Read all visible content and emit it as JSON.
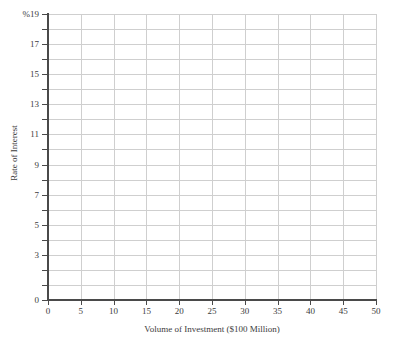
{
  "chart_data": {
    "type": "line",
    "title": "",
    "subtitle": "",
    "xlabel": "Volume of Investment ($100 Million)",
    "ylabel": "Rate of Interest",
    "y_unit_label": "%19",
    "xlim": [
      0,
      50
    ],
    "ylim": [
      0,
      19
    ],
    "x_ticks": [
      0,
      5,
      10,
      15,
      20,
      25,
      30,
      35,
      40,
      45,
      50
    ],
    "x_tick_labels": [
      "0",
      "5",
      "10",
      "15",
      "20",
      "25",
      "30",
      "35",
      "40",
      "45",
      "50"
    ],
    "y_ticks": [
      0,
      1,
      2,
      3,
      4,
      5,
      6,
      7,
      8,
      9,
      10,
      11,
      12,
      13,
      14,
      15,
      16,
      17,
      18,
      19
    ],
    "y_labeled_ticks": [
      0,
      3,
      5,
      7,
      9,
      11,
      13,
      15,
      17,
      19
    ],
    "y_tick_labels": [
      "0",
      "3",
      "5",
      "7",
      "9",
      "11",
      "13",
      "15",
      "17",
      "%19"
    ],
    "grid": {
      "horizontal": true,
      "horizontal_step": 1,
      "vertical": true,
      "vertical_step": 5,
      "color": "#cfcfcf"
    },
    "legend": null,
    "series": [],
    "annotations": [],
    "axis_color": "#4a4a4a",
    "text_color": "#3c3c3c",
    "background": "#ffffff"
  }
}
